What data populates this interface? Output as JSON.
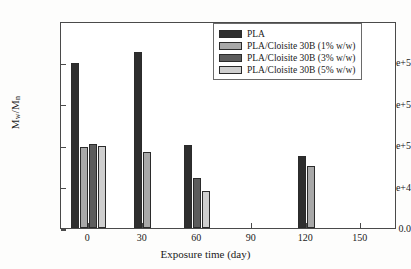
{
  "chart_data": {
    "type": "bar",
    "title": "",
    "xlabel": "Exposure time (day)",
    "ylabel": "Mw/Mn",
    "ylabel_parts": {
      "base1": "M",
      "sub1": "w",
      "slash": "/",
      "base2": "M",
      "sub2": "n"
    },
    "xlim": [
      -15,
      170
    ],
    "ylim": [
      0,
      250000
    ],
    "grid": false,
    "legend_position": "top-right",
    "xticks": [
      0,
      30,
      60,
      90,
      120,
      150
    ],
    "xtick_labels": [
      "0",
      "30",
      "60",
      "90",
      "120",
      "150"
    ],
    "yticks": [
      0,
      50000,
      100000,
      150000,
      200000
    ],
    "ytick_labels": [
      "0.0",
      "5e+4",
      "1e+5",
      "2e+5",
      "2e+5"
    ],
    "categories": [
      0,
      30,
      60,
      120
    ],
    "series": [
      {
        "name": "PLA",
        "color": "#2e2e2e",
        "values": [
          199000,
          212000,
          100000,
          87000
        ]
      },
      {
        "name": "PLA/Cloisite 30B (1% w/w)",
        "color": "#a8a8a8",
        "values": [
          98000,
          92000,
          null,
          74500
        ]
      },
      {
        "name": "PLA/Cloisite 30B (3% w/w)",
        "color": "#5c5c5c",
        "values": [
          102000,
          null,
          60000,
          null
        ]
      },
      {
        "name": "PLA/Cloisite 30B (5% w/w)",
        "color": "#cfcfcf",
        "values": [
          98500,
          null,
          45000,
          null
        ]
      }
    ],
    "bars": [
      {
        "x": 0,
        "series": "PLA",
        "value": 199000,
        "color": "#2e2e2e",
        "slot": 0
      },
      {
        "x": 0,
        "series": "PLA/Cloisite 30B (1% w/w)",
        "value": 98000,
        "color": "#a8a8a8",
        "slot": 1
      },
      {
        "x": 0,
        "series": "PLA/Cloisite 30B (3% w/w)",
        "value": 102000,
        "color": "#5c5c5c",
        "slot": 2
      },
      {
        "x": 0,
        "series": "PLA/Cloisite 30B (5% w/w)",
        "value": 98500,
        "color": "#cfcfcf",
        "slot": 3
      },
      {
        "x": 30,
        "series": "PLA",
        "value": 212000,
        "color": "#2e2e2e",
        "slot": 0
      },
      {
        "x": 30,
        "series": "PLA/Cloisite 30B (1% w/w)",
        "value": 92000,
        "color": "#a8a8a8",
        "slot": 1
      },
      {
        "x": 60,
        "series": "PLA",
        "value": 100000,
        "color": "#2e2e2e",
        "slot": 0
      },
      {
        "x": 60,
        "series": "PLA/Cloisite 30B (3% w/w)",
        "value": 60000,
        "color": "#5c5c5c",
        "slot": 1
      },
      {
        "x": 60,
        "series": "PLA/Cloisite 30B (5% w/w)",
        "value": 45000,
        "color": "#cfcfcf",
        "slot": 2
      },
      {
        "x": 120,
        "series": "PLA",
        "value": 87000,
        "color": "#2e2e2e",
        "slot": 0
      },
      {
        "x": 120,
        "series": "PLA/Cloisite 30B (1% w/w)",
        "value": 74500,
        "color": "#a8a8a8",
        "slot": 1
      }
    ],
    "legend": [
      {
        "label": "PLA",
        "color": "#2e2e2e"
      },
      {
        "label": "PLA/Cloisite 30B (1% w/w)",
        "color": "#a8a8a8"
      },
      {
        "label": "PLA/Cloisite 30B (3% w/w)",
        "color": "#5c5c5c"
      },
      {
        "label": "PLA/Cloisite 30B (5% w/w)",
        "color": "#cfcfcf"
      }
    ]
  },
  "style": {
    "axis_color": "#4a4a4a",
    "bar_edge_color": "#2b2b2b",
    "background": "#ffffff",
    "text_color": "#1a1a1a"
  }
}
